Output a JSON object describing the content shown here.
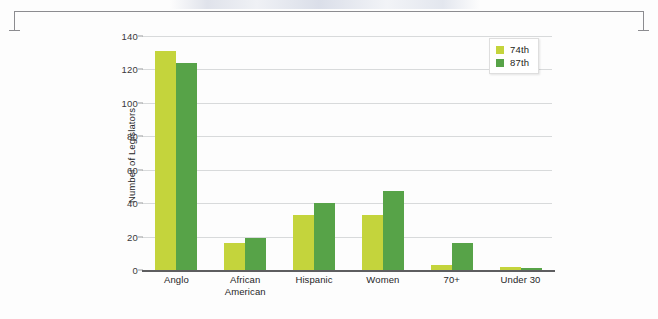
{
  "chart_data": {
    "type": "bar",
    "title": "",
    "xlabel": "",
    "ylabel": "Number of Legislators",
    "ylim": [
      0,
      140
    ],
    "yticks": [
      0,
      20,
      40,
      60,
      80,
      100,
      120,
      140
    ],
    "grid": true,
    "legend_position": "top-right",
    "categories": [
      "Anglo",
      "African American",
      "Hispanic",
      "Women",
      "70+",
      "Under 30"
    ],
    "category_lines": [
      [
        "Anglo",
        ""
      ],
      [
        "African",
        "American"
      ],
      [
        "Hispanic",
        ""
      ],
      [
        "Women",
        ""
      ],
      [
        "70+",
        ""
      ],
      [
        "Under 30",
        ""
      ]
    ],
    "series": [
      {
        "name": "74th",
        "color": "#c4d43c",
        "values": [
          131,
          16,
          33,
          33,
          3,
          2
        ]
      },
      {
        "name": "87th",
        "color": "#57a348",
        "values": [
          124,
          19,
          40,
          47,
          16,
          1
        ]
      }
    ]
  },
  "legend": {
    "items": [
      {
        "label": "74th",
        "color": "#c4d43c"
      },
      {
        "label": "87th",
        "color": "#57a348"
      }
    ]
  },
  "axis": {
    "y_label": "Number of Legislators",
    "y_ticks": [
      "0",
      "20",
      "40",
      "60",
      "80",
      "100",
      "120",
      "140"
    ]
  },
  "colors": {
    "series_74th": "#c4d43c",
    "series_87th": "#57a348",
    "gridline": "#d8dadb",
    "axis": "#5e5e60",
    "text": "#262628",
    "bracket": "#8c8c90"
  }
}
